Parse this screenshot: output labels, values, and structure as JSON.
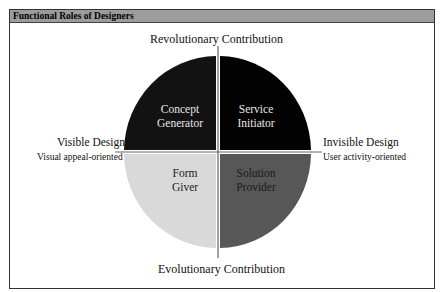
{
  "header": {
    "title": "Functional Roles of Designers"
  },
  "axes": {
    "top": "Revolutionary Contribution",
    "bottom": "Evolutionary Contribution",
    "left": {
      "title": "Visible Design",
      "subtitle": "Visual appeal-oriented"
    },
    "right": {
      "title": "Invisible Design",
      "subtitle": "User activity-oriented"
    }
  },
  "quadrants": [
    {
      "position": "top-left",
      "line1": "Concept",
      "line2": "Generator",
      "color": "#121212"
    },
    {
      "position": "top-right",
      "line1": "Service",
      "line2": "Initiator",
      "color": "#020202"
    },
    {
      "position": "bottom-left",
      "line1": "Form",
      "line2": "Giver",
      "color": "#d9d9d9"
    },
    {
      "position": "bottom-right",
      "line1": "Solution",
      "line2": "Provider",
      "color": "#575757"
    }
  ]
}
